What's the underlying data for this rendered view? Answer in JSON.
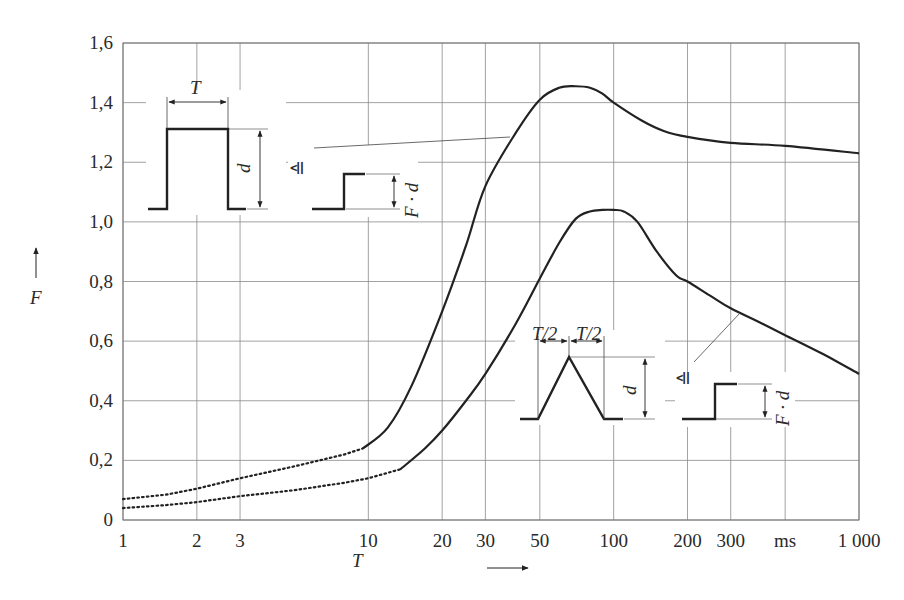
{
  "chart_data": {
    "type": "line",
    "title": "",
    "xlabel": "T",
    "xunit": "ms",
    "ylabel": "F",
    "xscale": "log",
    "xlim": [
      1,
      1000
    ],
    "ylim": [
      0,
      1.6
    ],
    "grid": true,
    "legend": null,
    "x_ticks": [
      {
        "value": 1,
        "label": "1"
      },
      {
        "value": 2,
        "label": "2"
      },
      {
        "value": 3,
        "label": "3"
      },
      {
        "value": 10,
        "label": "10"
      },
      {
        "value": 20,
        "label": "20"
      },
      {
        "value": 30,
        "label": "30"
      },
      {
        "value": 50,
        "label": "50"
      },
      {
        "value": 100,
        "label": "100"
      },
      {
        "value": 200,
        "label": "200"
      },
      {
        "value": 300,
        "label": "300"
      },
      {
        "value": 500,
        "label": "ms"
      },
      {
        "value": 1000,
        "label": "1 000"
      }
    ],
    "y_ticks": [
      {
        "value": 0,
        "label": "0"
      },
      {
        "value": 0.2,
        "label": "0,2"
      },
      {
        "value": 0.4,
        "label": "0,4"
      },
      {
        "value": 0.6,
        "label": "0,6"
      },
      {
        "value": 0.8,
        "label": "0,8"
      },
      {
        "value": 1.0,
        "label": "1,0"
      },
      {
        "value": 1.2,
        "label": "1,2"
      },
      {
        "value": 1.4,
        "label": "1,4"
      },
      {
        "value": 1.6,
        "label": "1,6"
      }
    ],
    "series": [
      {
        "name": "Rectangular pulse (duration T, amplitude d)",
        "dotted_segment": {
          "x": [
            1,
            1.5,
            2,
            3,
            5,
            8,
            9.5
          ],
          "y": [
            0.07,
            0.085,
            0.105,
            0.14,
            0.18,
            0.22,
            0.24
          ]
        },
        "x": [
          9.5,
          12,
          15,
          20,
          25,
          30,
          40,
          50,
          60,
          70,
          80,
          90,
          100,
          130,
          160,
          200,
          300,
          500,
          1000
        ],
        "y": [
          0.24,
          0.31,
          0.45,
          0.7,
          0.92,
          1.12,
          1.3,
          1.41,
          1.45,
          1.455,
          1.45,
          1.43,
          1.4,
          1.34,
          1.305,
          1.285,
          1.265,
          1.255,
          1.23
        ]
      },
      {
        "name": "Triangular pulse (rise T/2, fall T/2, amplitude d)",
        "dotted_segment": {
          "x": [
            1,
            1.5,
            2,
            3,
            5,
            8,
            10,
            13.5
          ],
          "y": [
            0.04,
            0.05,
            0.06,
            0.08,
            0.1,
            0.125,
            0.14,
            0.17
          ]
        },
        "x": [
          13.5,
          17,
          20,
          25,
          30,
          40,
          50,
          60,
          70,
          80,
          90,
          100,
          110,
          125,
          150,
          180,
          200,
          250,
          300,
          400,
          500,
          700,
          1000
        ],
        "y": [
          0.17,
          0.24,
          0.3,
          0.4,
          0.49,
          0.66,
          0.81,
          0.93,
          1.01,
          1.035,
          1.04,
          1.04,
          1.035,
          1.0,
          0.9,
          0.82,
          0.8,
          0.75,
          0.71,
          0.66,
          0.62,
          0.56,
          0.49
        ]
      }
    ],
    "annotations": [
      {
        "type": "inset",
        "shape": "rectangular pulse",
        "labels": [
          "T",
          "d"
        ]
      },
      {
        "type": "inset",
        "shape": "equivalent step",
        "symbol": "≙",
        "label": "F · d",
        "points_to": "upper curve near T≈45"
      },
      {
        "type": "inset",
        "shape": "triangular pulse",
        "labels": [
          "T/2",
          "T/2",
          "d"
        ]
      },
      {
        "type": "inset",
        "shape": "equivalent step",
        "symbol": "≙",
        "label": "F · d",
        "points_to": "lower curve near T≈330"
      }
    ]
  },
  "labels": {
    "y_axis": "F",
    "x_axis": "T",
    "inset1_T": "T",
    "inset1_d": "d",
    "inset1_equiv": "≙",
    "inset1_Fd": "F · d",
    "inset2_half1": "T/2",
    "inset2_half2": "T/2",
    "inset2_d": "d",
    "inset2_equiv": "≙",
    "inset2_Fd": "F · d"
  },
  "colors": {
    "curve": "#222222",
    "grid": "#8a8a8a",
    "text": "#2a2a2a"
  }
}
